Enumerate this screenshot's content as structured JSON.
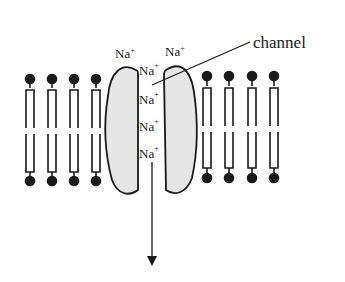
{
  "diagram": {
    "labels": {
      "channel": "channel"
    },
    "ions": [
      {
        "symbol": "Na",
        "charge": "+",
        "position": "outside-left"
      },
      {
        "symbol": "Na",
        "charge": "+",
        "position": "outside-right"
      },
      {
        "symbol": "Na",
        "charge": "+",
        "position": "in-channel-1"
      },
      {
        "symbol": "Na",
        "charge": "+",
        "position": "in-channel-2"
      },
      {
        "symbol": "Na",
        "charge": "+",
        "position": "in-channel-3"
      },
      {
        "symbol": "Na",
        "charge": "+",
        "position": "in-channel-4"
      }
    ],
    "phospholipids_left": 4,
    "phospholipids_right": 4,
    "arrow": "downward (ion flow into cell)",
    "colors": {
      "line": "#1a1a1a",
      "protein_fill": "#e6e6e6",
      "background": "#ffffff"
    }
  }
}
